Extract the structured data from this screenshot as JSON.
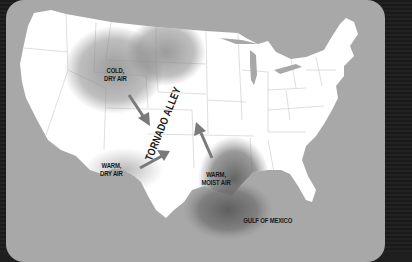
{
  "map": {
    "title": "Tornado Alley",
    "region": "Contiguous United States",
    "labels": {
      "tornado_alley": "TORNADO ALLEY",
      "cold_dry_air": [
        "COLD,",
        "DRY AIR"
      ],
      "warm_dry_air": [
        "WARM,",
        "DRY AIR"
      ],
      "warm_moist_air": [
        "WARM,",
        "MOIST AIR"
      ],
      "gulf_of_mexico": "GULF OF MEXICO"
    },
    "air_masses": [
      {
        "name": "cold-dry-air",
        "source": "north / Rocky Mountains",
        "flow": "southeast"
      },
      {
        "name": "warm-dry-air",
        "source": "southwest",
        "flow": "northeast"
      },
      {
        "name": "warm-moist-air",
        "source": "Gulf of Mexico",
        "flow": "north"
      }
    ],
    "colors": {
      "land": "#ffffff",
      "water": "#a8a8a8",
      "air_mass_shade": "#8a8a8a",
      "arrow": "#7a7a7a",
      "border": "#1f1f1f",
      "text": "#1a1a1a"
    }
  }
}
